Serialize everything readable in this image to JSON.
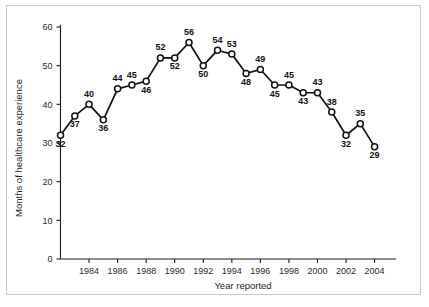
{
  "chart_data": {
    "type": "line",
    "title": "",
    "xlabel": "Year reported",
    "ylabel": "Months of healthcare experience",
    "xlim": [
      1982,
      2005.5
    ],
    "ylim": [
      0,
      60
    ],
    "grid": false,
    "legend": null,
    "marker": "open-circle",
    "x": [
      1982,
      1983,
      1984,
      1985,
      1986,
      1987,
      1988,
      1989,
      1990,
      1991,
      1992,
      1993,
      1994,
      1995,
      1996,
      1997,
      1998,
      1999,
      2000,
      2001,
      2002,
      2003,
      2004
    ],
    "values": [
      32,
      37,
      40,
      36,
      44,
      45,
      46,
      52,
      52,
      56,
      50,
      54,
      53,
      48,
      49,
      45,
      45,
      43,
      43,
      38,
      32,
      35,
      29
    ],
    "data_labels": [
      "32",
      "37",
      "40",
      "36",
      "44",
      "45",
      "46",
      "52",
      "52",
      "56",
      "50",
      "54",
      "53",
      "48",
      "49",
      "45",
      "45",
      "43",
      "43",
      "38",
      "32",
      "35",
      "29"
    ],
    "label_placement": [
      "below",
      "below",
      "above",
      "below",
      "above",
      "above",
      "below",
      "above",
      "below",
      "above",
      "below",
      "above",
      "above",
      "below",
      "above",
      "below",
      "above",
      "below",
      "above",
      "above",
      "below",
      "above",
      "below"
    ],
    "yticks": [
      0,
      10,
      20,
      30,
      40,
      50,
      60
    ],
    "ytick_labels": [
      "0",
      "10",
      "20",
      "30",
      "40",
      "50",
      "60"
    ],
    "xticks": [
      1984,
      1986,
      1988,
      1990,
      1992,
      1994,
      1996,
      1998,
      2000,
      2002,
      2004
    ],
    "xtick_labels": [
      "1984",
      "1986",
      "1988",
      "1990",
      "1992",
      "1994",
      "1996",
      "1998",
      "2000",
      "2002",
      "2004"
    ]
  },
  "colors": {
    "line": "#111111",
    "marker_fill": "#ffffff",
    "axis": "#1a1a1a",
    "frame": "#c9c9c9",
    "background": "#ffffff",
    "text": "#1f1f1f"
  }
}
